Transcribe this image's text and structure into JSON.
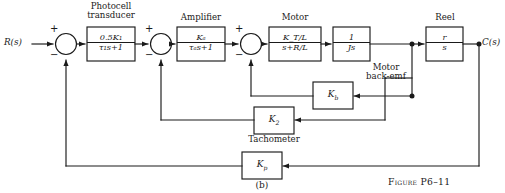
{
  "figure": {
    "panel_label": "(b)",
    "caption": "Figure P6–11"
  },
  "signals": {
    "input": "R(s)",
    "output": "C(s)"
  },
  "group_labels": {
    "photocell": "Photocell\ntransducer",
    "photocell_line1": "Photocell",
    "photocell_line2": "transducer",
    "amplifier": "Amplifier",
    "motor": "Motor",
    "reel": "Reel",
    "back_emf_line1": "Motor",
    "back_emf_line2": "back-emf",
    "tachometer": "Tachometer"
  },
  "blocks": [
    {
      "id": "photocell",
      "numerator": "0.5K₁",
      "denominator": "τ₁s+1"
    },
    {
      "id": "amplifier",
      "numerator": "Kₐ",
      "denominator": "τₐs+1"
    },
    {
      "id": "motor",
      "numerator": "K_T/L",
      "denominator": "s+R/L"
    },
    {
      "id": "inertia",
      "numerator": "1",
      "denominator": "Js"
    },
    {
      "id": "reel",
      "numerator": "r",
      "denominator": "s"
    }
  ],
  "gain_blocks": [
    {
      "id": "back-emf",
      "label": "Kb"
    },
    {
      "id": "tachometer-gain",
      "label": "K2"
    },
    {
      "id": "position-gain",
      "label": "Kp"
    }
  ],
  "summing_junctions": [
    {
      "id": "outer-loop",
      "plus": "+",
      "minus": "−"
    },
    {
      "id": "tachometer-loop",
      "plus": "+",
      "minus": "−"
    },
    {
      "id": "back-emf-loop",
      "plus": "+",
      "minus": "−"
    }
  ],
  "colors": {
    "line": "#1a1a1a",
    "background": "#ffffff"
  }
}
